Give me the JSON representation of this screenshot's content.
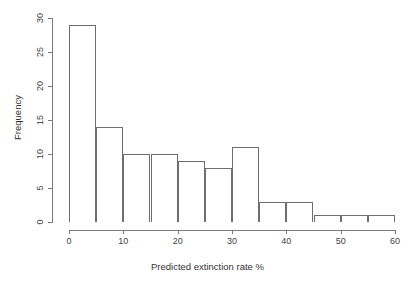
{
  "chart_data": {
    "type": "bar",
    "title": "",
    "xlabel": "Predicted extinction rate %",
    "ylabel": "Frequency",
    "xlim": [
      0,
      60
    ],
    "ylim": [
      0,
      30
    ],
    "grid": false,
    "legend": null,
    "bin_width": 5,
    "bin_edges": [
      0,
      5,
      10,
      15,
      20,
      25,
      30,
      35,
      40,
      45,
      50,
      55,
      60
    ],
    "categories": [
      "0-5",
      "5-10",
      "10-15",
      "15-20",
      "20-25",
      "25-30",
      "30-35",
      "35-40",
      "40-45",
      "45-50",
      "50-55",
      "55-60"
    ],
    "values": [
      29,
      14,
      10,
      10,
      9,
      8,
      11,
      3,
      3,
      1,
      1,
      1
    ],
    "x_tick_labels": [
      "0",
      "10",
      "20",
      "30",
      "40",
      "50",
      "60"
    ],
    "x_tick_values": [
      0,
      10,
      20,
      30,
      40,
      50,
      60
    ],
    "y_tick_labels": [
      "0",
      "5",
      "10",
      "15",
      "20",
      "25",
      "30"
    ],
    "y_tick_values": [
      0,
      5,
      10,
      15,
      20,
      25,
      30
    ],
    "colors": {
      "background": "#ffffff",
      "bar_fill": "#ffffff",
      "bar_stroke": "#6e6e6e",
      "axis": "#7a7a7a",
      "text": "#333333"
    }
  }
}
